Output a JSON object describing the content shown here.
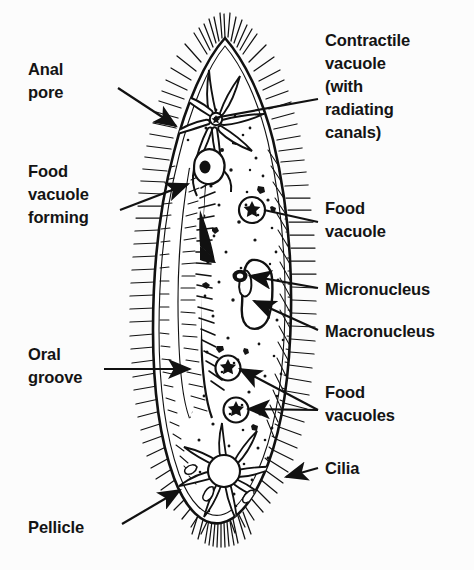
{
  "figure": {
    "organism": "Paramecium",
    "style": "black and white line drawing / stipple engraving",
    "background_color": "#fcfcfc",
    "ink_color": "#111111"
  },
  "labels": [
    {
      "id": "anal-pore",
      "text": "Anal\npore",
      "side": "left",
      "x": 28,
      "y": 60,
      "leader": {
        "from": [
          118,
          88
        ],
        "to": [
          176,
          126
        ],
        "arrow": "to"
      }
    },
    {
      "id": "food-vacuole-forming",
      "text": "Food\nvacuole\nforming",
      "side": "left",
      "x": 28,
      "y": 162,
      "leader": {
        "from": [
          120,
          210
        ],
        "to": [
          186,
          184
        ],
        "arrow": "to"
      }
    },
    {
      "id": "oral-groove",
      "text": "Oral\ngroove",
      "side": "left",
      "x": 28,
      "y": 345,
      "leader": {
        "from": [
          104,
          369
        ],
        "to": [
          188,
          369
        ],
        "arrow": "to"
      }
    },
    {
      "id": "pellicle",
      "text": "Pellicle",
      "side": "left",
      "x": 28,
      "y": 518,
      "leader": {
        "from": [
          122,
          524
        ],
        "to": [
          178,
          489
        ],
        "arrow": "to"
      }
    },
    {
      "id": "contractile-vacuole",
      "text": "Contractile\nvacuole\n(with\nradiating\ncanals)",
      "side": "right",
      "x": 325,
      "y": 31,
      "leader": {
        "from": [
          318,
          99
        ],
        "to": [
          214,
          118
        ],
        "arrow": "none"
      }
    },
    {
      "id": "food-vacuole",
      "text": "Food\nvacuole",
      "side": "right",
      "x": 325,
      "y": 199,
      "leader": {
        "from": [
          318,
          222
        ],
        "to": [
          262,
          209
        ],
        "arrow": "none"
      }
    },
    {
      "id": "micronucleus",
      "text": "Micronucleus",
      "side": "right",
      "x": 325,
      "y": 281,
      "leader": {
        "from": [
          318,
          288
        ],
        "to": [
          248,
          275
        ],
        "arrow": "to"
      }
    },
    {
      "id": "macronucleus",
      "text": "Macronucleus",
      "side": "right",
      "x": 325,
      "y": 326,
      "leader": {
        "from": [
          318,
          330
        ],
        "to": [
          252,
          300
        ],
        "arrow": "to"
      }
    },
    {
      "id": "food-vacuoles",
      "text": "Food\nvacuoles",
      "side": "right",
      "x": 325,
      "y": 383,
      "leaders": [
        {
          "from": [
            318,
            410
          ],
          "to": [
            236,
            369
          ],
          "arrow": "to"
        },
        {
          "from": [
            318,
            410
          ],
          "to": [
            243,
            408
          ],
          "arrow": "to"
        }
      ]
    },
    {
      "id": "cilia",
      "text": "Cilia",
      "side": "right",
      "x": 325,
      "y": 460,
      "leader": {
        "from": [
          318,
          468
        ],
        "to": [
          283,
          476
        ],
        "arrow": "to"
      }
    }
  ],
  "structures": [
    {
      "id": "pellicle-outline",
      "name": "Pellicle (cell membrane outline)"
    },
    {
      "id": "cilia-fringe",
      "name": "Cilia fringe around entire body"
    },
    {
      "id": "oral-groove-channel",
      "name": "Oral groove / gullet channel"
    },
    {
      "id": "anal-pore-opening",
      "name": "Anal pore on left margin"
    },
    {
      "id": "contractile-vacuole-anterior",
      "name": "Anterior contractile vacuole with radiating canals"
    },
    {
      "id": "contractile-vacuole-posterior",
      "name": "Posterior contractile vacuole with radiating canals"
    },
    {
      "id": "macronucleus-body",
      "name": "Macronucleus"
    },
    {
      "id": "micronucleus-body",
      "name": "Micronucleus"
    },
    {
      "id": "food-vacuole-upper",
      "name": "Food vacuole (upper)"
    },
    {
      "id": "food-vacuole-mid",
      "name": "Food vacuole (mid)"
    },
    {
      "id": "food-vacuole-lower",
      "name": "Food vacuole (lower)"
    },
    {
      "id": "food-vacuole-forming-body",
      "name": "Food vacuole forming at gullet base"
    },
    {
      "id": "cytoplasm-stipple",
      "name": "Stippled cytoplasm granules"
    }
  ]
}
